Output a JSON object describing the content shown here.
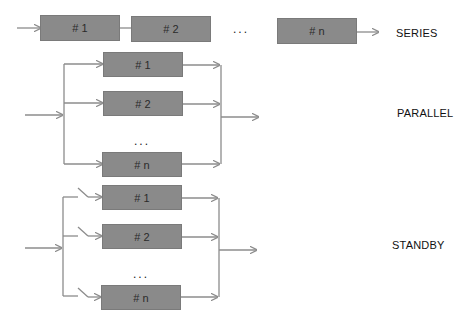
{
  "series": {
    "label": "SERIES",
    "blocks": [
      "# 1",
      "# 2",
      "# n"
    ],
    "ellipsis": "..."
  },
  "parallel": {
    "label": "PARALLEL",
    "blocks": [
      "# 1",
      "# 2",
      "# n"
    ],
    "ellipsis": "..."
  },
  "standby": {
    "label": "STANDBY",
    "blocks": [
      "# 1",
      "# 2",
      "# n"
    ],
    "ellipsis": "..."
  },
  "colors": {
    "block_fill": "#8a8a8a",
    "line": "#8c8c8c"
  }
}
